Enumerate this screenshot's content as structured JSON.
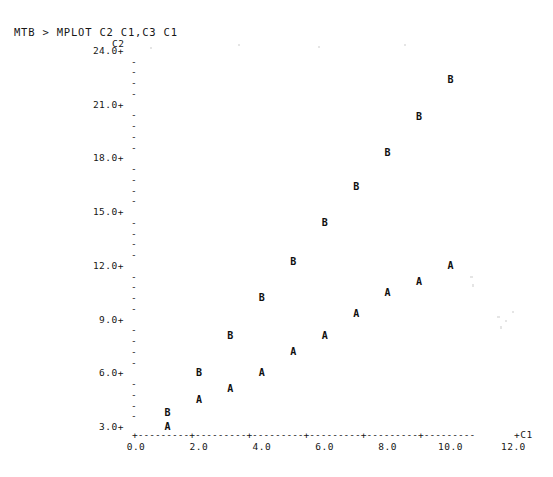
{
  "terminal": {
    "prompt_line": "MTB > MPLOT C2 C1,C3 C1",
    "y_variable_label": "C2",
    "x_variable_label": "+C1",
    "axis_line": "+---------+---------+---------+---------+---------+---------",
    "tick_plus": "+",
    "tick_dash": "-"
  },
  "chart_data": {
    "type": "scatter",
    "title": "",
    "subtitle": "",
    "xlabel": "C1",
    "ylabel": "C2",
    "xlim": [
      0.0,
      12.0
    ],
    "ylim": [
      3.0,
      24.0
    ],
    "grid": false,
    "legend": "none",
    "minor_ticks_per_major": 4,
    "xticks": [
      "0.0",
      "2.0",
      "4.0",
      "6.0",
      "8.0",
      "10.0",
      "12.0"
    ],
    "xtick_values": [
      0.0,
      2.0,
      4.0,
      6.0,
      8.0,
      10.0,
      12.0
    ],
    "yticks": [
      "24.0+",
      "21.0+",
      "18.0+",
      "15.0+",
      "12.0+",
      "9.0+",
      "6.0+",
      "3.0+"
    ],
    "ytick_values": [
      24.0,
      21.0,
      18.0,
      15.0,
      12.0,
      9.0,
      6.0,
      3.0
    ],
    "series": [
      {
        "name": "A",
        "marker": "A",
        "variable": "C2",
        "x": [
          1.0,
          2.0,
          3.0,
          4.0,
          5.0,
          6.0,
          7.0,
          8.0,
          9.0,
          10.0
        ],
        "values": [
          3.0,
          4.5,
          5.1,
          6.0,
          7.2,
          8.1,
          9.3,
          10.5,
          11.1,
          12.0
        ]
      },
      {
        "name": "B",
        "marker": "B",
        "variable": "C3",
        "x": [
          1.0,
          2.0,
          3.0,
          4.0,
          5.0,
          6.0,
          7.0,
          8.0,
          9.0,
          10.0
        ],
        "values": [
          3.8,
          6.0,
          8.1,
          10.2,
          12.2,
          14.4,
          16.4,
          18.3,
          20.3,
          22.4
        ]
      }
    ]
  },
  "colors": {
    "background": "#ffffff",
    "ink": "#161616",
    "marker": "#101010"
  }
}
